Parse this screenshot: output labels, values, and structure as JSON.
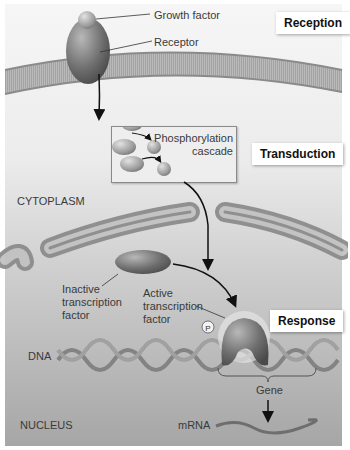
{
  "figure": {
    "stages": {
      "reception": "Reception",
      "transduction": "Transduction",
      "response": "Response"
    },
    "labels": {
      "growth_factor": "Growth factor",
      "receptor": "Receptor",
      "phosphorylation_line1": "Phosphorylation",
      "phosphorylation_line2": "cascade",
      "cytoplasm": "CYTOPLASM",
      "inactive_tf_line1": "Inactive",
      "inactive_tf_line2": "transcription",
      "inactive_tf_line3": "factor",
      "active_tf_line1": "Active",
      "active_tf_line2": "transcription",
      "active_tf_line3": "factor",
      "phosphate": "P",
      "dna": "DNA",
      "gene": "Gene",
      "nucleus": "NUCLEUS",
      "mrna": "mRNA"
    },
    "colors": {
      "background_top": "#f4f4f4",
      "background_bottom": "#a9a9a9",
      "membrane": "#8c8c8c",
      "protein_dark": "#5a5a5a",
      "protein_light": "#b5b5b5",
      "arrow": "#111111",
      "stage_label_bg": "#ffffff"
    }
  }
}
